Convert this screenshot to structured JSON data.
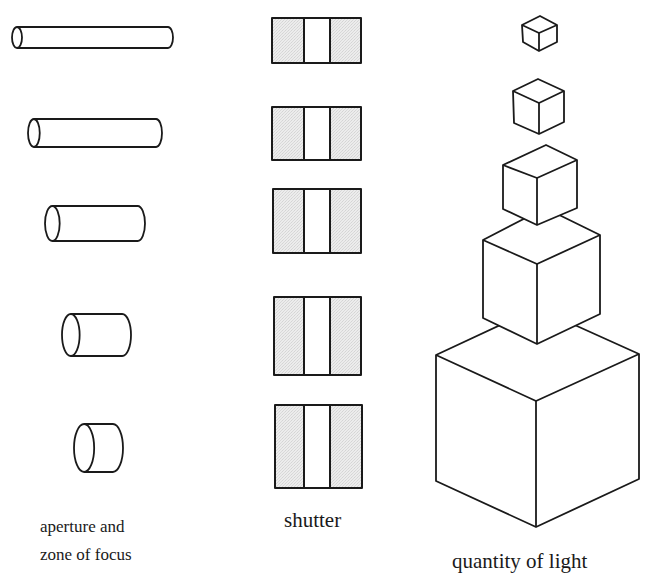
{
  "header": {
    "caption_cropped": ""
  },
  "columns": {
    "aperture": {
      "label_line1": "aperture and",
      "label_line2": "zone of focus",
      "cylinders": [
        {
          "x1": 12,
          "x2": 173,
          "y1": 27,
          "y2": 48
        },
        {
          "x1": 28,
          "x2": 162,
          "y1": 119,
          "y2": 147
        },
        {
          "x1": 45,
          "x2": 145,
          "y1": 206,
          "y2": 241
        },
        {
          "x1": 62,
          "x2": 131,
          "y1": 314,
          "y2": 356
        },
        {
          "x1": 74,
          "x2": 123,
          "y1": 424,
          "y2": 472
        }
      ]
    },
    "shutter": {
      "label": "shutter",
      "fill_color": "#e6e6e6",
      "frames": [
        {
          "x1": 272,
          "x2": 361,
          "y1": 18,
          "y2": 63
        },
        {
          "x1": 272,
          "x2": 361,
          "y1": 107,
          "y2": 160
        },
        {
          "x1": 273,
          "x2": 361,
          "y1": 189,
          "y2": 253
        },
        {
          "x1": 274,
          "x2": 361,
          "y1": 297,
          "y2": 375
        },
        {
          "x1": 275,
          "x2": 362,
          "y1": 405,
          "y2": 488
        }
      ],
      "slit": {
        "x1": 304,
        "x2": 330
      }
    },
    "light": {
      "label": "quantity of light",
      "cubes": [
        {
          "top": [
            540,
            16
          ],
          "lt": [
            522,
            25
          ],
          "rt": [
            557,
            25
          ],
          "c": [
            539,
            33
          ],
          "lb": [
            523,
            42
          ],
          "b": [
            539,
            51
          ],
          "rb": [
            557,
            42
          ]
        },
        {
          "top": [
            538,
            79
          ],
          "lt": [
            513,
            91
          ],
          "rt": [
            564,
            91
          ],
          "c": [
            539,
            103
          ],
          "lb": [
            514,
            123
          ],
          "b": [
            539,
            134
          ],
          "rb": [
            564,
            122
          ]
        },
        {
          "top": [
            546,
            145
          ],
          "lt": [
            503,
            165
          ],
          "rt": [
            577,
            160
          ],
          "c": [
            537,
            178
          ],
          "lb": [
            503,
            209
          ],
          "b": [
            537,
            225
          ],
          "rb": [
            577,
            208
          ]
        },
        {
          "top": [
            545,
            208
          ],
          "lt": [
            483,
            240
          ],
          "rt": [
            600,
            235
          ],
          "c": [
            537,
            264
          ],
          "lb": [
            483,
            318
          ],
          "b": [
            537,
            344
          ],
          "rb": [
            600,
            314
          ]
        },
        {
          "top": [
            537,
            308
          ],
          "lt": [
            436,
            355
          ],
          "rt": [
            639,
            354
          ],
          "c": [
            536,
            401
          ],
          "lb": [
            436,
            481
          ],
          "b": [
            536,
            527
          ],
          "rb": [
            639,
            479
          ]
        }
      ]
    }
  }
}
